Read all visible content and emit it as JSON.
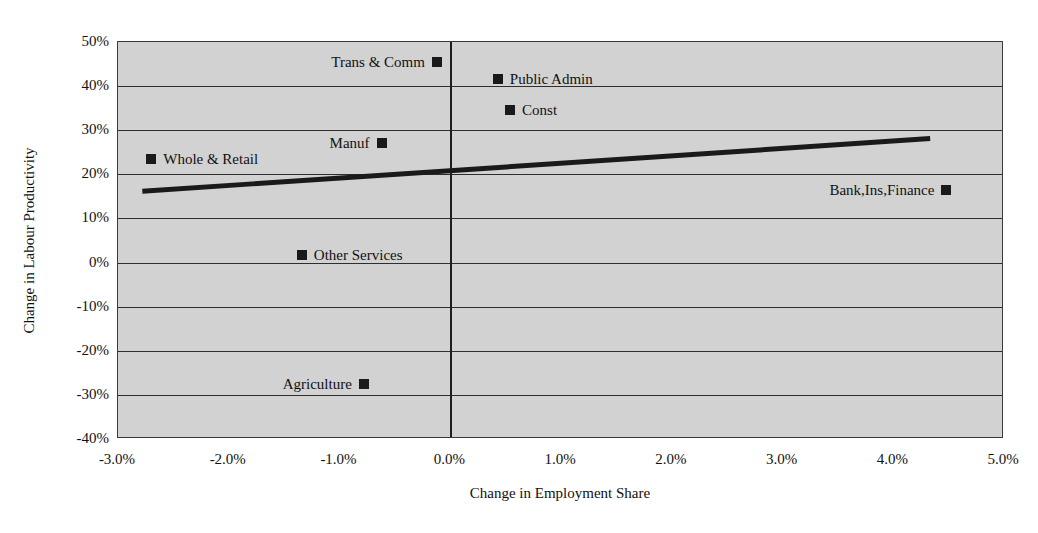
{
  "chart_data": {
    "type": "scatter",
    "title": "",
    "xlabel": "Change in Employment Share",
    "ylabel": "Change in Labour Productivity",
    "xlim": [
      -3.0,
      5.0
    ],
    "ylim": [
      -40,
      50
    ],
    "grid": true,
    "legend": "none",
    "xticks": [
      "-3.0%",
      "-2.0%",
      "-1.0%",
      "0.0%",
      "1.0%",
      "2.0%",
      "3.0%",
      "4.0%",
      "5.0%"
    ],
    "xtick_values": [
      -3.0,
      -2.0,
      -1.0,
      0.0,
      1.0,
      2.0,
      3.0,
      4.0,
      5.0
    ],
    "yticks": [
      "50%",
      "40%",
      "30%",
      "20%",
      "10%",
      "0%",
      "-10%",
      "-20%",
      "-30%",
      "-40%"
    ],
    "ytick_values": [
      50,
      40,
      30,
      20,
      10,
      0,
      -10,
      -20,
      -30,
      -40
    ],
    "points": [
      {
        "label": "Trans & Comm",
        "x": -0.12,
        "y": 45.5,
        "label_side": "left"
      },
      {
        "label": "Public Admin",
        "x": 0.43,
        "y": 41.5,
        "label_side": "right"
      },
      {
        "label": "Const",
        "x": 0.54,
        "y": 34.5,
        "label_side": "right"
      },
      {
        "label": "Manuf",
        "x": -0.62,
        "y": 27.0,
        "label_side": "left"
      },
      {
        "label": "Whole & Retail",
        "x": -2.7,
        "y": 23.5,
        "label_side": "right"
      },
      {
        "label": "Bank,Ins,Finance",
        "x": 4.48,
        "y": 16.5,
        "label_side": "left"
      },
      {
        "label": "Other Services",
        "x": -1.34,
        "y": 1.8,
        "label_side": "right"
      },
      {
        "label": "Agriculture",
        "x": -0.78,
        "y": -27.5,
        "label_side": "left"
      }
    ],
    "trendline": {
      "x_start": -2.78,
      "y_start": 16.0,
      "x_end": 4.35,
      "y_end": 28.0,
      "color": "#1a1a1a"
    },
    "zero_line_x": 0.0,
    "colors": {
      "plot_background": "#d2d2d2",
      "grid": "#2e2e2e",
      "marker": "#1a1a1a",
      "border": "#3a3a3a",
      "page_background": "#ffffff"
    }
  }
}
